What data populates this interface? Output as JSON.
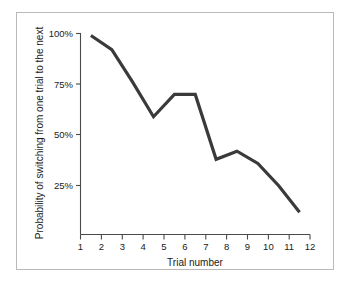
{
  "figure": {
    "border_color": "#b9b9b9",
    "background": "#ffffff"
  },
  "chart_data": {
    "type": "line",
    "title": "",
    "xlabel": "Trial number",
    "ylabel": "Probability of switching from one trial to the next",
    "x": [
      1.5,
      2.5,
      3.5,
      4.5,
      5.5,
      6.5,
      7.5,
      8.5,
      9.5,
      10.5,
      11.5
    ],
    "values": [
      99,
      92,
      76,
      59,
      70,
      70,
      38,
      42,
      36,
      25,
      12
    ],
    "series": [
      {
        "name": "Probability of switching",
        "values": [
          99,
          92,
          76,
          59,
          70,
          70,
          38,
          42,
          36,
          25,
          12
        ],
        "color": "#3a3a3a"
      }
    ],
    "xlim": [
      1,
      12
    ],
    "ylim": [
      0,
      100
    ],
    "xticks": [
      1,
      2,
      3,
      4,
      5,
      6,
      7,
      8,
      9,
      10,
      11,
      12
    ],
    "xticklabels": [
      "1",
      "2",
      "3",
      "4",
      "5",
      "6",
      "7",
      "8",
      "9",
      "10",
      "11",
      "12"
    ],
    "yticks": [
      25,
      50,
      75,
      100
    ],
    "yticklabels": [
      "25%",
      "50%",
      "75%",
      "100%"
    ],
    "grid": false,
    "legend": false,
    "line_color": "#3a3a3a",
    "axis_color": "#4a4a4a"
  },
  "axes": {
    "x_title": "Trial number",
    "y_title": "Probability of switching from one trial to the next"
  },
  "xticklabels": {
    "0": "1",
    "1": "2",
    "2": "3",
    "3": "4",
    "4": "5",
    "5": "6",
    "6": "7",
    "7": "8",
    "8": "9",
    "9": "10",
    "10": "11",
    "11": "12"
  },
  "yticklabels": {
    "0": "25%",
    "1": "50%",
    "2": "75%",
    "3": "100%"
  }
}
